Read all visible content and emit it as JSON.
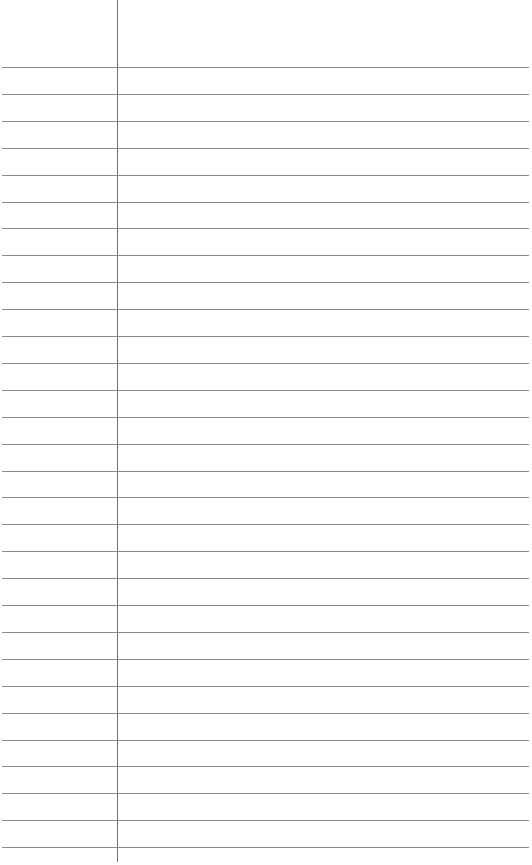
{
  "page": {
    "type": "lined-paper",
    "background": "#ffffff",
    "rule_color": "#8a8a8a",
    "margin_color": "#6f6f6f",
    "margin_x": 117,
    "first_rule_y": 67,
    "rule_spacing": 26.9,
    "rule_count": 30
  }
}
